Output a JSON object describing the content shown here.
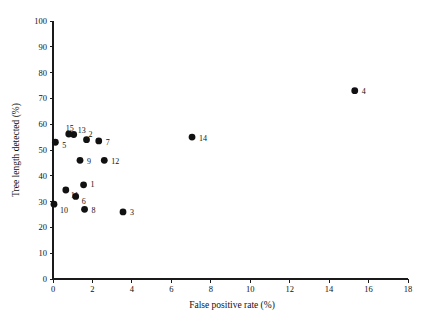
{
  "chart_data": {
    "type": "scatter",
    "title": "",
    "xlabel": "False positive rate (%)",
    "ylabel": "Tree length detected (%)",
    "xlim": [
      0,
      18
    ],
    "ylim": [
      0,
      100
    ],
    "xticks": [
      0,
      2,
      4,
      6,
      8,
      10,
      12,
      14,
      16,
      18
    ],
    "yticks": [
      0,
      10,
      20,
      30,
      40,
      50,
      60,
      70,
      80,
      90,
      100
    ],
    "xtick_labels": [
      "0",
      "2",
      "4",
      "6",
      "8",
      "10",
      "12",
      "14",
      "16",
      "18"
    ],
    "ytick_labels": [
      "0",
      "10",
      "20",
      "30",
      "40",
      "50",
      "60",
      "70",
      "80",
      "90",
      "100"
    ],
    "grid": false,
    "legend": "none",
    "marker_color": "#111111",
    "axis_color": "#1a1a1a",
    "points": [
      {
        "label": "1",
        "x": 1.55,
        "y": 36.5,
        "label_dx": 7,
        "label_dy": 0
      },
      {
        "label": "2",
        "x": 1.7,
        "y": 54.0,
        "label_dx": 2,
        "label_dy": -5
      },
      {
        "label": "3",
        "x": 3.55,
        "y": 26.0,
        "label_dx": 7,
        "label_dy": 1
      },
      {
        "label": "4",
        "x": 15.3,
        "y": 73.0,
        "label_dx": 7,
        "label_dy": 1
      },
      {
        "label": "5",
        "x": 0.12,
        "y": 53.0,
        "label_dx": 7,
        "label_dy": 3
      },
      {
        "label": "6",
        "x": 1.15,
        "y": 32.0,
        "label_dx": 6,
        "label_dy": 5
      },
      {
        "label": "7",
        "x": 2.32,
        "y": 53.5,
        "label_dx": 7,
        "label_dy": 2
      },
      {
        "label": "8",
        "x": 1.6,
        "y": 27.0,
        "label_dx": 7,
        "label_dy": 1
      },
      {
        "label": "9",
        "x": 1.37,
        "y": 46.0,
        "label_dx": 7,
        "label_dy": 1
      },
      {
        "label": "10",
        "x": 0.05,
        "y": 29.0,
        "label_dx": 6,
        "label_dy": 6
      },
      {
        "label": "11",
        "x": 0.65,
        "y": 34.5,
        "label_dx": 5,
        "label_dy": 6
      },
      {
        "label": "12",
        "x": 2.6,
        "y": 46.0,
        "label_dx": 7,
        "label_dy": 1
      },
      {
        "label": "13",
        "x": 1.05,
        "y": 56.0,
        "label_dx": 4,
        "label_dy": -4
      },
      {
        "label": "14",
        "x": 7.05,
        "y": 55.0,
        "label_dx": 7,
        "label_dy": 1
      },
      {
        "label": "15",
        "x": 0.8,
        "y": 56.2,
        "label_dx": -3,
        "label_dy": -6
      }
    ]
  }
}
